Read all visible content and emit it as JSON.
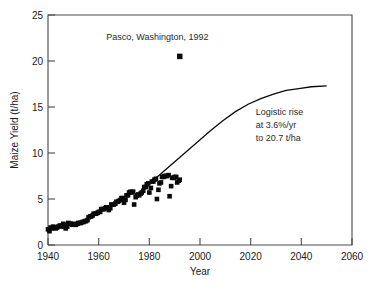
{
  "chart_data": {
    "type": "scatter",
    "title": "",
    "xlabel": "Year",
    "ylabel": "Maize Yield (t/ha)",
    "xlim": [
      1940,
      2060
    ],
    "ylim": [
      0,
      25
    ],
    "xticks": [
      1940,
      1960,
      1980,
      2000,
      2020,
      2040,
      2060
    ],
    "yticks": [
      0,
      5,
      10,
      15,
      20,
      25
    ],
    "grid": false,
    "legend": null,
    "annotations": [
      {
        "name": "pasco-label",
        "text": "Pasco, Washington, 1992",
        "x": 1963,
        "y": 22.3
      },
      {
        "name": "logistic-note-line1",
        "text": "Logistic rise",
        "x": 2022,
        "y": 14.1
      },
      {
        "name": "logistic-note-line2",
        "text": "at 3.6%/yr",
        "x": 2022,
        "y": 12.7
      },
      {
        "name": "logistic-note-line3",
        "text": "to 20.7 t/ha",
        "x": 2022,
        "y": 11.3
      }
    ],
    "series": [
      {
        "name": "Pasco record yield",
        "type": "scatter",
        "marker": "square",
        "color": "#0a0a0a",
        "points": [
          [
            1992,
            20.5
          ]
        ]
      },
      {
        "name": "US maize yield observations",
        "type": "scatter",
        "marker": "square",
        "color": "#0a0a0a",
        "points": [
          [
            1940,
            1.7
          ],
          [
            1940.6,
            1.5
          ],
          [
            1941,
            1.9
          ],
          [
            1941.6,
            1.8
          ],
          [
            1942,
            2.0
          ],
          [
            1942.6,
            1.9
          ],
          [
            1943,
            1.8
          ],
          [
            1943.6,
            1.9
          ],
          [
            1944,
            2.0
          ],
          [
            1944.6,
            2.1
          ],
          [
            1945,
            2.1
          ],
          [
            1945.6,
            2.0
          ],
          [
            1946,
            2.3
          ],
          [
            1946.6,
            2.2
          ],
          [
            1947,
            1.8
          ],
          [
            1947.6,
            2.0
          ],
          [
            1948,
            2.4
          ],
          [
            1948.6,
            2.3
          ],
          [
            1949,
            2.3
          ],
          [
            1949.6,
            2.2
          ],
          [
            1950,
            2.3
          ],
          [
            1950.6,
            2.2
          ],
          [
            1951,
            2.2
          ],
          [
            1951.6,
            2.3
          ],
          [
            1952,
            2.4
          ],
          [
            1952.6,
            2.4
          ],
          [
            1953,
            2.4
          ],
          [
            1953.6,
            2.5
          ],
          [
            1954,
            2.5
          ],
          [
            1954.6,
            2.6
          ],
          [
            1955,
            2.6
          ],
          [
            1955.6,
            2.7
          ],
          [
            1956,
            3.0
          ],
          [
            1956.6,
            3.1
          ],
          [
            1957,
            3.1
          ],
          [
            1957.6,
            3.2
          ],
          [
            1958,
            3.4
          ],
          [
            1958.6,
            3.4
          ],
          [
            1959,
            3.4
          ],
          [
            1959.6,
            3.5
          ],
          [
            1960,
            3.6
          ],
          [
            1960.6,
            3.6
          ],
          [
            1961,
            3.9
          ],
          [
            1961.6,
            3.9
          ],
          [
            1962,
            3.9
          ],
          [
            1962.6,
            4.0
          ],
          [
            1963,
            4.1
          ],
          [
            1963.6,
            4.1
          ],
          [
            1964,
            3.8
          ],
          [
            1964.6,
            4.0
          ],
          [
            1965,
            4.4
          ],
          [
            1965.6,
            4.4
          ],
          [
            1966,
            4.4
          ],
          [
            1966.6,
            4.5
          ],
          [
            1967,
            4.7
          ],
          [
            1967.6,
            4.7
          ],
          [
            1968,
            4.8
          ],
          [
            1968.6,
            4.9
          ],
          [
            1969,
            5.1
          ],
          [
            1969.6,
            5.1
          ],
          [
            1970,
            4.6
          ],
          [
            1970.6,
            4.9
          ],
          [
            1971,
            5.4
          ],
          [
            1971.6,
            5.4
          ],
          [
            1972,
            5.7
          ],
          [
            1972.6,
            5.8
          ],
          [
            1973,
            5.7
          ],
          [
            1973.6,
            5.8
          ],
          [
            1974,
            4.4
          ],
          [
            1974.6,
            5.2
          ],
          [
            1975,
            5.4
          ],
          [
            1975.6,
            5.5
          ],
          [
            1976,
            5.4
          ],
          [
            1976.6,
            5.6
          ],
          [
            1977,
            5.7
          ],
          [
            1977.6,
            5.9
          ],
          [
            1978,
            6.3
          ],
          [
            1978.6,
            6.3
          ],
          [
            1979,
            6.6
          ],
          [
            1979.6,
            6.7
          ],
          [
            1980,
            5.7
          ],
          [
            1980.6,
            6.2
          ],
          [
            1981,
            6.9
          ],
          [
            1981.6,
            6.9
          ],
          [
            1982,
            7.1
          ],
          [
            1982.6,
            7.2
          ],
          [
            1983,
            5.0
          ],
          [
            1983.6,
            6.0
          ],
          [
            1984,
            6.7
          ],
          [
            1984.6,
            6.8
          ],
          [
            1985,
            7.4
          ],
          [
            1985.6,
            7.4
          ],
          [
            1986,
            7.5
          ],
          [
            1986.6,
            7.5
          ],
          [
            1987,
            7.5
          ],
          [
            1987.6,
            7.6
          ],
          [
            1988,
            5.3
          ],
          [
            1988.6,
            6.4
          ],
          [
            1989,
            7.3
          ],
          [
            1989.6,
            7.3
          ],
          [
            1990,
            7.4
          ],
          [
            1990.6,
            7.4
          ],
          [
            1991,
            6.8
          ],
          [
            1991.6,
            7.0
          ],
          [
            1992,
            7.1
          ]
        ]
      },
      {
        "name": "Logistic projection",
        "type": "line",
        "color": "#0a0a0a",
        "description": "Logistic rise at 3.6%/yr to 20.7 t/ha",
        "growth_rate_percent_per_year": 3.6,
        "asymptote_t_per_ha": 20.7,
        "points": [
          [
            1979,
            6.5
          ],
          [
            1984,
            7.6
          ],
          [
            1989,
            8.8
          ],
          [
            1994,
            10.0
          ],
          [
            1999,
            11.2
          ],
          [
            2004,
            12.4
          ],
          [
            2009,
            13.5
          ],
          [
            2014,
            14.5
          ],
          [
            2019,
            15.3
          ],
          [
            2024,
            15.9
          ],
          [
            2029,
            16.4
          ],
          [
            2034,
            16.8
          ],
          [
            2039,
            17.0
          ],
          [
            2044,
            17.2
          ],
          [
            2050,
            17.3
          ]
        ]
      }
    ]
  },
  "figure": {
    "caption_fragment": ""
  }
}
